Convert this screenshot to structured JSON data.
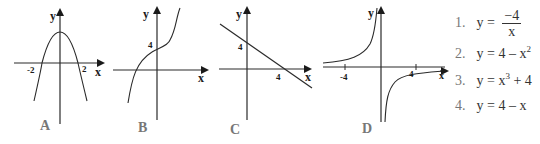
{
  "graphs": [
    {
      "id": "A",
      "label": "A",
      "axis_x": "x",
      "axis_y": "y",
      "ticks": [
        "-2",
        "2"
      ],
      "curve": "downward parabola, vertex at (0,4), roots at x=-2 and x=2"
    },
    {
      "id": "B",
      "label": "B",
      "axis_x": "x",
      "axis_y": "y",
      "ticks": [
        "4"
      ],
      "curve": "cubic, increasing, y-intercept 4"
    },
    {
      "id": "C",
      "label": "C",
      "axis_x": "x",
      "axis_y": "y",
      "ticks": [
        "4",
        "4"
      ],
      "curve": "line with negative slope, intercepts (0,4) and (4,0)"
    },
    {
      "id": "D",
      "label": "D",
      "axis_x": "x",
      "axis_y": "y",
      "ticks": [
        "-4",
        "4"
      ],
      "curve": "hyperbola in quadrants II and IV"
    }
  ],
  "equations": [
    {
      "num": "1.",
      "prefix": "y =",
      "frac_num": "−4",
      "frac_den": "x"
    },
    {
      "num": "2.",
      "text": "y = 4 – x",
      "sup": "2"
    },
    {
      "num": "3.",
      "text": "y = x",
      "sup": "3",
      "suffix": " + 4"
    },
    {
      "num": "4.",
      "text": "y = 4 – x"
    }
  ]
}
